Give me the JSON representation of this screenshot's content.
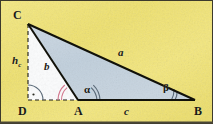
{
  "figure": {
    "width": 213,
    "height": 124,
    "background_color": "#f2e472",
    "triangle_fill_color": "#c3d2de",
    "inner_triangle_fill_color": "#fbfcfd",
    "stroke_color": "#0f0f0c",
    "accent_arc_color": "#d2788f",
    "angle_arc_color": "#5b6a78",
    "border_color": "#3d3a2c"
  },
  "vertices": [
    {
      "name": "C",
      "label": "C",
      "x": 28,
      "y": 24
    },
    {
      "name": "D",
      "label": "D",
      "x": 28,
      "y": 100
    },
    {
      "name": "A",
      "label": "A",
      "x": 78,
      "y": 100
    },
    {
      "name": "B",
      "label": "B",
      "x": 195,
      "y": 100
    }
  ],
  "labels": {
    "vertex_C": "C",
    "vertex_D": "D",
    "vertex_A": "A",
    "vertex_B": "B",
    "side_a": "a",
    "side_b": "b",
    "side_c": "c",
    "altitude_h": "h",
    "altitude_sub": "c",
    "angle_alpha": "α",
    "angle_beta": "β"
  },
  "segments": [
    {
      "name": "side-a-CB",
      "from": "C",
      "to": "B",
      "label": "a",
      "style": "solid"
    },
    {
      "name": "side-b-CA",
      "from": "C",
      "to": "A",
      "label": "b",
      "style": "solid"
    },
    {
      "name": "side-c-AB",
      "from": "A",
      "to": "B",
      "label": "c",
      "style": "solid"
    },
    {
      "name": "altitude-CD",
      "from": "C",
      "to": "D",
      "label": "h_c",
      "style": "dashed"
    },
    {
      "name": "base-extension-DA",
      "from": "D",
      "to": "A",
      "label": "",
      "style": "dashed"
    }
  ],
  "angle_marks": [
    {
      "name": "angle-alpha-at-A",
      "vertex": "A",
      "label": "α",
      "color": "#5b6a78"
    },
    {
      "name": "angle-beta-at-B",
      "vertex": "B",
      "label": "β",
      "color": "#5b6a78"
    },
    {
      "name": "exterior-angle-at-A",
      "vertex": "A",
      "label": "",
      "color": "#d2788f"
    },
    {
      "name": "right-angle-at-D",
      "vertex": "D",
      "label": "",
      "color": "#5b6a78"
    }
  ]
}
